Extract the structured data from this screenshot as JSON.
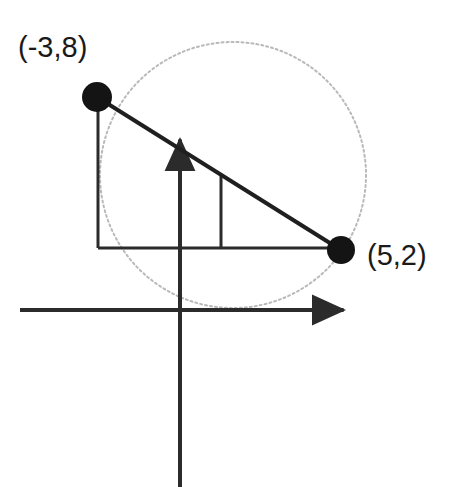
{
  "figure": {
    "canvas": {
      "width": 452,
      "height": 487,
      "background": "#ffffff"
    }
  },
  "labels": {
    "point_a": "(-3,8)",
    "point_b": "(5,2)"
  },
  "colors": {
    "ink": "#1a1a1a",
    "axis": "#2b2b2b",
    "circle_outline": "#b9b9b9",
    "marker_fill": "#141414",
    "background": "#ffffff"
  },
  "chart_data": {
    "type": "scatter",
    "title": "",
    "xlabel": "",
    "ylabel": "",
    "grid": false,
    "legend": null,
    "xlim": [
      -8,
      8
    ],
    "ylim": [
      -8,
      12
    ],
    "points": [
      {
        "name": "point-a",
        "label": "(-3,8)",
        "x": -3,
        "y": 8,
        "px": 97,
        "py": 97,
        "radius_px": 15
      },
      {
        "name": "point-b",
        "label": "(5,2)",
        "x": 5,
        "y": 2,
        "px": 341,
        "py": 250,
        "radius_px": 14
      }
    ],
    "circle": {
      "name": "circle-through-points",
      "center_px": [
        233,
        175
      ],
      "radius_px": 133,
      "center_data": [
        1,
        5
      ],
      "radius_data": 5,
      "style": "dotted",
      "stroke": "#b9b9b9"
    },
    "segments": [
      {
        "name": "diameter-segment",
        "from_px": [
          97,
          97
        ],
        "to_px": [
          341,
          250
        ],
        "style": "solid",
        "stroke": "#1f1f1f",
        "width_px": 4
      },
      {
        "name": "horizontal-leg",
        "from_px": [
          98,
          248
        ],
        "to_px": [
          341,
          248
        ],
        "style": "solid",
        "stroke": "#2b2b2b",
        "width_px": 3
      },
      {
        "name": "vertical-leg",
        "from_px": [
          98,
          97
        ],
        "to_px": [
          98,
          248
        ],
        "style": "solid",
        "stroke": "#2b2b2b",
        "width_px": 3
      },
      {
        "name": "inner-vertical-tick",
        "from_px": [
          221,
          176
        ],
        "to_px": [
          221,
          248
        ],
        "style": "solid",
        "stroke": "#2b2b2b",
        "width_px": 3
      }
    ],
    "axes": [
      {
        "name": "x-axis",
        "from_px": [
          20,
          310
        ],
        "to_px": [
          350,
          310
        ],
        "arrow": "end",
        "stroke": "#2b2b2b",
        "width_px": 4
      },
      {
        "name": "y-axis",
        "from_px": [
          180,
          487
        ],
        "to_px": [
          180,
          133
        ],
        "arrow": "end",
        "stroke": "#2b2b2b",
        "width_px": 4
      }
    ]
  }
}
